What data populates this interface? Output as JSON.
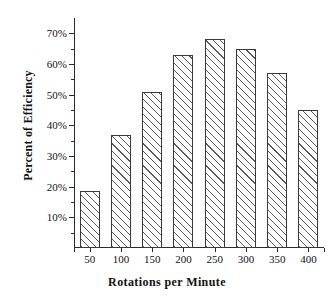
{
  "chart_data": {
    "type": "bar",
    "title": "",
    "xlabel": "Rotations per Minute",
    "ylabel": "Percent of Efficiency",
    "categories": [
      "50",
      "100",
      "150",
      "200",
      "250",
      "300",
      "350",
      "400"
    ],
    "values": [
      18.5,
      37,
      51,
      63,
      68,
      65,
      57,
      45
    ],
    "ylim": [
      0,
      75
    ],
    "ytick_values": [
      10,
      20,
      30,
      40,
      50,
      60,
      70
    ],
    "ytick_labels": [
      "10%",
      "20%",
      "30%",
      "40%",
      "50%",
      "60%",
      "70%"
    ],
    "yminor_tick_values": [
      5,
      15,
      25,
      35,
      45,
      55,
      65
    ],
    "grid": false,
    "legend": null,
    "bar_fill": "#ffffff",
    "bar_edge_color": "#3a3a3a",
    "bar_hatch": "diagonal-forward",
    "axis_color": "#2b2b2b",
    "background": "#ffffff"
  }
}
